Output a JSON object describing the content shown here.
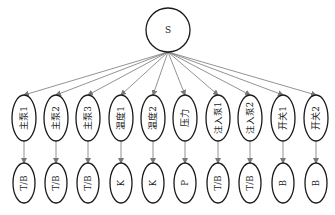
{
  "root": {
    "label": "S",
    "cx": 168,
    "cy": 30,
    "r": 22
  },
  "colors": {
    "stroke": "#1a1a1a",
    "edge": "#777777",
    "text": "#222222"
  },
  "nodes": [
    {
      "label": "主泵1",
      "type": "T/B",
      "x": 24
    },
    {
      "label": "主泵2",
      "type": "T/B",
      "x": 56
    },
    {
      "label": "主泵3",
      "type": "T/B",
      "x": 88
    },
    {
      "label": "温度1",
      "type": "K",
      "x": 121
    },
    {
      "label": "温度2",
      "type": "K",
      "x": 153
    },
    {
      "label": "压力",
      "type": "P",
      "x": 185
    },
    {
      "label": "注入泵1",
      "type": "T/B",
      "x": 218
    },
    {
      "label": "注入泵2",
      "type": "T/B",
      "x": 250
    },
    {
      "label": "开关1",
      "type": "B",
      "x": 283
    },
    {
      "label": "开关2",
      "type": "B",
      "x": 316
    }
  ]
}
